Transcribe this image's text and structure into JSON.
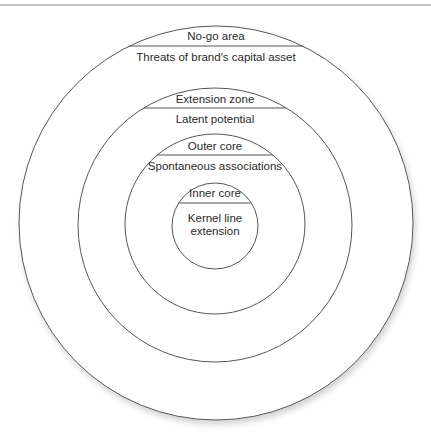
{
  "diagram": {
    "type": "concentric-circles",
    "colors": {
      "stroke": "#555555",
      "text": "#2a2a2a",
      "background": "#ffffff"
    },
    "rings": [
      {
        "name": "outer-ring",
        "zone_label": "No-go area",
        "description": "Threats of brand's capital asset"
      },
      {
        "name": "second-ring",
        "zone_label": "Extension zone",
        "description": "Latent potential"
      },
      {
        "name": "third-ring",
        "zone_label": "Outer core",
        "description": "Spontaneous associations"
      },
      {
        "name": "inner-ring",
        "zone_label": "Inner core",
        "description_line1": "Kernel line",
        "description_line2": "extension"
      }
    ]
  }
}
